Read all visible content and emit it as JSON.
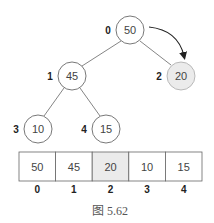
{
  "tree": {
    "nodes": [
      {
        "index": "0",
        "value": "50",
        "cx": 130,
        "cy": 30,
        "highlight": false
      },
      {
        "index": "1",
        "value": "45",
        "cx": 72,
        "cy": 76,
        "highlight": false
      },
      {
        "index": "2",
        "value": "20",
        "cx": 181,
        "cy": 76,
        "highlight": true
      },
      {
        "index": "3",
        "value": "10",
        "cx": 38,
        "cy": 129,
        "highlight": false
      },
      {
        "index": "4",
        "value": "15",
        "cx": 106,
        "cy": 129,
        "highlight": false
      }
    ],
    "edges": [
      [
        "0",
        "1"
      ],
      [
        "0",
        "2"
      ],
      [
        "1",
        "3"
      ],
      [
        "1",
        "4"
      ]
    ],
    "arrow": {
      "from": "0",
      "to": "2"
    }
  },
  "array": {
    "cells": [
      {
        "value": "50",
        "index": "0",
        "highlight": false
      },
      {
        "value": "45",
        "index": "1",
        "highlight": false
      },
      {
        "value": "20",
        "index": "2",
        "highlight": true
      },
      {
        "value": "10",
        "index": "3",
        "highlight": false
      },
      {
        "value": "15",
        "index": "4",
        "highlight": false
      }
    ]
  },
  "caption": "图 5.62",
  "colors": {
    "stroke": "#555555",
    "highlight_fill": "#ebebeb",
    "fill": "#ffffff",
    "arrow": "#222222"
  }
}
